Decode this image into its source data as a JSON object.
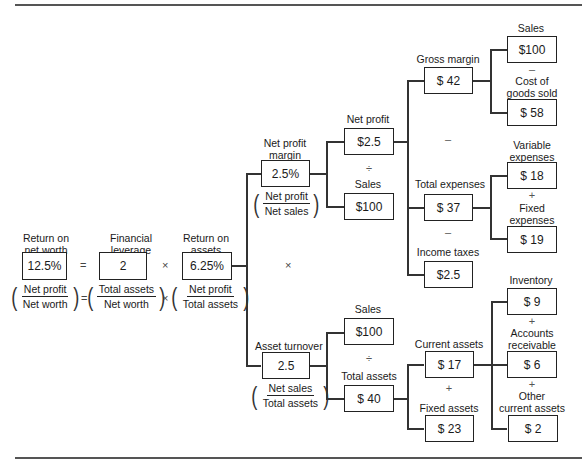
{
  "root": {
    "return_on_net_worth": {
      "label_l1": "Return on",
      "label_l2": "net worth",
      "value": "12.5%",
      "frac_num": "Net profit",
      "frac_den": "Net worth"
    },
    "equals": "=",
    "financial_leverage": {
      "label_l1": "Financial",
      "label_l2": "leverage",
      "value": "2",
      "frac_num": "Total assets",
      "frac_den": "Net worth"
    },
    "times": "×",
    "return_on_assets": {
      "label_l1": "Return on",
      "label_l2": "assets",
      "value": "6.25%",
      "frac_num": "Net profit",
      "frac_den": "Total assets"
    }
  },
  "branch_times": "×",
  "net_profit_margin": {
    "label_l1": "Net profit",
    "label_l2": "margin",
    "value": "2.5%",
    "frac_num": "Net profit",
    "frac_den": "Net sales"
  },
  "asset_turnover": {
    "label": "Asset turnover",
    "value": "2.5",
    "frac_num": "Net sales",
    "frac_den": "Total assets"
  },
  "level2": {
    "net_profit": {
      "label": "Net profit",
      "value": "$2.5"
    },
    "div1": "÷",
    "sales_top": {
      "label": "Sales",
      "value": "$100"
    },
    "sales_bottom": {
      "label": "Sales",
      "value": "$100"
    },
    "div2": "÷",
    "total_assets": {
      "label": "Total assets",
      "value": "$ 40"
    }
  },
  "level3": {
    "gross_margin": {
      "label": "Gross margin",
      "value": "$ 42"
    },
    "minus1": "–",
    "total_expenses": {
      "label": "Total expenses",
      "value": "$ 37"
    },
    "minus2": "–",
    "income_taxes": {
      "label": "Income taxes",
      "value": "$2.5"
    },
    "current_assets": {
      "label": "Current assets",
      "value": "$ 17"
    },
    "plus1": "+",
    "fixed_assets": {
      "label": "Fixed assets",
      "value": "$ 23"
    }
  },
  "level4": {
    "sales": {
      "label": "Sales",
      "value": "$100"
    },
    "minus": "–",
    "cogs": {
      "label_l1": "Cost of",
      "label_l2": "goods sold",
      "value": "$ 58"
    },
    "variable_expenses": {
      "label_l1": "Variable",
      "label_l2": "expenses",
      "value": "$ 18"
    },
    "plus_exp": "+",
    "fixed_expenses": {
      "label_l1": "Fixed",
      "label_l2": "expenses",
      "value": "$ 19"
    },
    "inventory": {
      "label": "Inventory",
      "value": "$ 9"
    },
    "plus_a": "+",
    "accounts_receivable": {
      "label_l1": "Accounts",
      "label_l2": "receivable",
      "value": "$ 6"
    },
    "plus_b": "+",
    "other_current_assets": {
      "label_l1": "Other",
      "label_l2": "current assets",
      "value": "$ 2"
    }
  }
}
